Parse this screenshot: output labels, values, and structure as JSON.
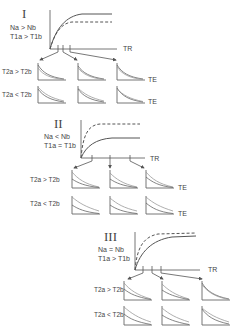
{
  "panels": [
    {
      "id": "I",
      "numeral": "I",
      "condition_n": "Na > Nb",
      "condition_t1": "T1a > T1b",
      "x_axis_label": "TR",
      "rows": [
        {
          "label": "T2a > T2b",
          "te_label": "TE"
        },
        {
          "label": "T2a < T2b",
          "te_label": "TE"
        }
      ],
      "curves": {
        "solid_plateau": "higher",
        "dashed_plateau": "lower"
      }
    },
    {
      "id": "II",
      "numeral": "II",
      "condition_n": "Na < Nb",
      "condition_t1": "T1a = T1b",
      "x_axis_label": "TR",
      "rows": [
        {
          "label": "T2a > T2b",
          "te_label": "TE"
        },
        {
          "label": "T2a < T2b",
          "te_label": "TE"
        }
      ],
      "curves": {
        "solid_plateau": "lower",
        "dashed_plateau": "higher"
      }
    },
    {
      "id": "III",
      "numeral": "III",
      "condition_n": "Na = Nb",
      "condition_t1": "T1a > T1b",
      "x_axis_label": "TR",
      "rows": [
        {
          "label": "T2a > T2b",
          "te_label": ""
        },
        {
          "label": "T2a < T2b",
          "te_label": ""
        }
      ],
      "curves": {
        "solid_plateau": "equal-slower",
        "dashed_plateau": "equal-faster"
      }
    }
  ]
}
